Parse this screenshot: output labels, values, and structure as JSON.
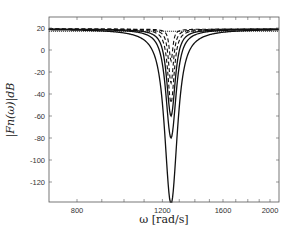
{
  "chart_data": {
    "type": "line",
    "title": "",
    "xlabel": "ω [rad/s]",
    "ylabel": "|F_n(ω)|_dB",
    "xscale": "log",
    "xlim": [
      700,
      2090
    ],
    "ylim": [
      -138,
      30
    ],
    "xticks": [
      800,
      1200,
      1600,
      2000
    ],
    "yticks": [
      20,
      0,
      -20,
      -40,
      -60,
      -80,
      -100,
      -120,
      -140
    ],
    "grid": false,
    "legend": null,
    "notch_center": 1250,
    "series": [
      {
        "name": "solid-1",
        "style": "solid",
        "baseline_db": 19,
        "min_db": -140,
        "halfwidth": 0.055
      },
      {
        "name": "solid-2",
        "style": "solid",
        "baseline_db": 19,
        "min_db": -80,
        "halfwidth": 0.045
      },
      {
        "name": "solid-3",
        "style": "solid",
        "baseline_db": 19,
        "min_db": -60,
        "halfwidth": 0.037
      },
      {
        "name": "dashed-1",
        "style": "dashed",
        "baseline_db": 19,
        "min_db": -48,
        "halfwidth": 0.028
      },
      {
        "name": "dashed-2",
        "style": "dashed",
        "baseline_db": 19,
        "min_db": -30,
        "halfwidth": 0.022
      },
      {
        "name": "dashed-3",
        "style": "dashed",
        "baseline_db": 19,
        "min_db": -10,
        "halfwidth": 0.016
      },
      {
        "name": "dotted-flat",
        "style": "dotted",
        "baseline_db": 17,
        "min_db": 17,
        "halfwidth": 0
      }
    ]
  },
  "labels": {
    "x_axis": "ω [rad/s]",
    "y_axis": "|Fn(ω)|dB"
  },
  "ticks": {
    "x": [
      "800",
      "1200",
      "1600",
      "2000"
    ],
    "y": [
      "20",
      "0",
      "-20",
      "-40",
      "-60",
      "-80",
      "-100",
      "-120",
      "-140"
    ]
  }
}
